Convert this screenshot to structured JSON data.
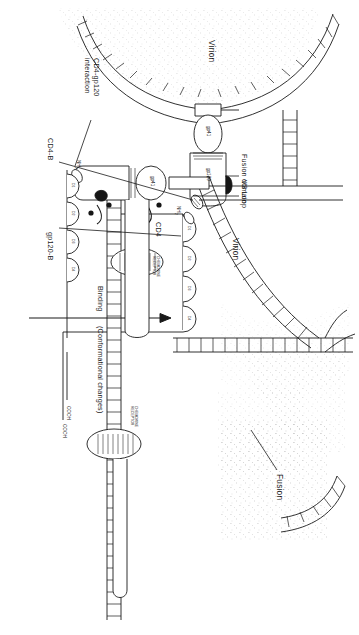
{
  "figure": {
    "type": "scientific-diagram",
    "orientation": "rotated-90-clockwise",
    "panels": [
      {
        "id": "binding",
        "position": "lower-left",
        "virion_label": "Virion"
      },
      {
        "id": "fusion",
        "position": "upper-right",
        "virion_label": "Virion"
      }
    ]
  },
  "labels": {
    "virion_left": "Virion",
    "virion_right": "Virion",
    "fusion_domain": "Fusion domain",
    "v3_loop": "V3 Loop",
    "cd4_binding_site": "CD4-B",
    "gp120_binding_site": "gp120-B",
    "cd4": "CD4",
    "gp41": "gp41",
    "gp120": "gp120",
    "nh2": "NH",
    "nh2_sub": "2",
    "cooh": "COOH",
    "chemokine_receptor": "CHEMOKINE RECEPTOR",
    "cd4_gp120_interaction": "CD4-gp120 interaction",
    "fusion": "Fusion",
    "arrow_primary": "Binding",
    "arrow_secondary": "(Conformational changes)"
  },
  "cd4_domains": {
    "left_panel": [
      "D1",
      "D2",
      "D3",
      "D4"
    ],
    "right_panel": [
      "D1",
      "D2",
      "D3",
      "D4"
    ]
  },
  "colors": {
    "ink": "#1a1a1a",
    "line": "#2b2b2b",
    "fill": "#ffffff",
    "stipple": "#9a9a9a",
    "dark_blob": "#151515"
  }
}
